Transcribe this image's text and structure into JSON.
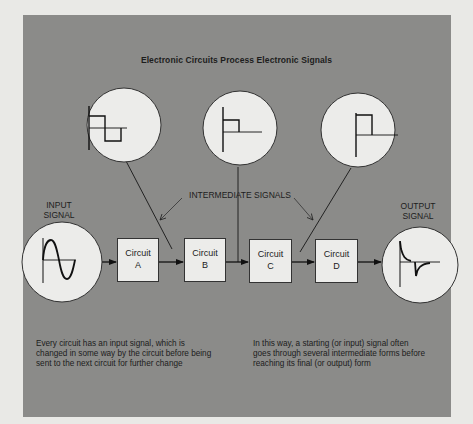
{
  "title": "Electronic Circuits Process Electronic Signals",
  "labels": {
    "input_signal": [
      "INPUT",
      "SIGNAL"
    ],
    "output_signal": [
      "OUTPUT",
      "SIGNAL"
    ],
    "intermediate_signals": "INTERMEDIATE SIGNALS"
  },
  "circuits": [
    {
      "line1": "Circuit",
      "line2": "A"
    },
    {
      "line1": "Circuit",
      "line2": "B"
    },
    {
      "line1": "Circuit",
      "line2": "C"
    },
    {
      "line1": "Circuit",
      "line2": "D"
    }
  ],
  "signals": {
    "input": "sine-wave",
    "intermediate": [
      "square-wave-bipolar",
      "positive-pulse-short",
      "positive-pulse"
    ],
    "output": "differentiated-spike"
  },
  "captions": {
    "left": [
      "Every circuit has an input signal, which is",
      "changed in some way by the circuit before being",
      "sent to the next circuit for further change"
    ],
    "right": [
      "In this way, a starting (or input) signal often",
      "goes through several intermediate forms before",
      "reaching its final (or output) form"
    ]
  },
  "colors": {
    "panel": "#8b8b89",
    "background": "#e9e9e6",
    "circle_fill": "#ececea",
    "ink": "#1d1d1d"
  }
}
